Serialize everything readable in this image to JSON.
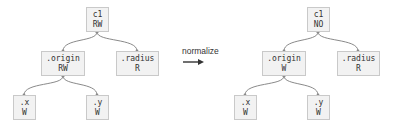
{
  "left_tree": {
    "root": {
      "name": "c1",
      "mode": "RW"
    },
    "origin": {
      "name": ".origin",
      "mode": "RW"
    },
    "radius": {
      "name": ".radius",
      "mode": "R"
    },
    "x": {
      "name": ".x",
      "mode": "W"
    },
    "y": {
      "name": ".y",
      "mode": "W"
    }
  },
  "transform": {
    "label": "normalize"
  },
  "right_tree": {
    "root": {
      "name": "c1",
      "mode": "NO"
    },
    "origin": {
      "name": ".origin",
      "mode": "W"
    },
    "radius": {
      "name": ".radius",
      "mode": "R"
    },
    "x": {
      "name": ".x",
      "mode": "W"
    },
    "y": {
      "name": ".y",
      "mode": "W"
    }
  },
  "colors": {
    "node_fill": "#f2f2f2",
    "node_border": "#c9c9c9",
    "wire": "#8a8a8a",
    "text": "#333333"
  }
}
